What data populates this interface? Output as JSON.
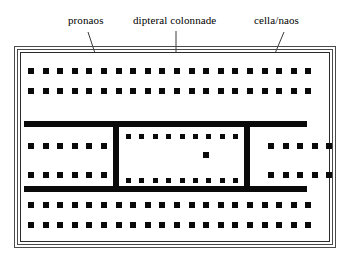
{
  "diagram": {
    "background": "#ffffff",
    "ink": "#0a0a0a",
    "frame_color": "#4a4a4a"
  },
  "labels": [
    {
      "id": "pronaos",
      "text": "pronaos",
      "x": 68,
      "y": 14
    },
    {
      "id": "dipteral",
      "text": "dipteral colonnade",
      "x": 133,
      "y": 14
    },
    {
      "id": "cella",
      "text": "cella/naos",
      "x": 254,
      "y": 14
    }
  ],
  "leaders": [
    {
      "id": "pronaos-leader",
      "x1": 88,
      "y1": 32,
      "x2": 124,
      "y2": 141
    },
    {
      "id": "dipteral-leader",
      "x1": 176,
      "y1": 31,
      "x2": 176,
      "y2": 79
    },
    {
      "id": "cella-leader",
      "x1": 284,
      "y1": 32,
      "x2": 231,
      "y2": 158
    }
  ],
  "frame": {
    "outer": {
      "x": 14,
      "y": 46,
      "w": 322,
      "h": 202
    },
    "mid": {
      "x": 17,
      "y": 49,
      "w": 316,
      "h": 196
    },
    "inner": {
      "x": 20,
      "y": 52,
      "w": 310,
      "h": 190
    }
  },
  "peristyle": {
    "description": "double outer colonnade rows, top and bottom",
    "columns_per_row": 20,
    "x_start": 28,
    "x_step": 14.6,
    "rows_y": [
      68,
      88,
      202,
      222
    ]
  },
  "side_colonnade": {
    "description": "inner side rows inside the middle zone, left and right of cella",
    "rows_y": [
      143,
      172
    ],
    "left_x_start": 28,
    "left_count": 6,
    "right_x_start": 268,
    "right_count": 5,
    "x_step": 14.6
  },
  "cella": {
    "wall_thickness": 6,
    "top_wall": {
      "x": 24,
      "y": 121,
      "w": 283,
      "h": 6
    },
    "bottom_wall": {
      "x": 24,
      "y": 186,
      "w": 283,
      "h": 6
    },
    "left_wall": {
      "x": 113,
      "y": 121,
      "w": 6,
      "h": 71
    },
    "right_wall": {
      "x": 244,
      "y": 121,
      "w": 6,
      "h": 71
    },
    "interior_rows_y": [
      134,
      178
    ],
    "interior_x_start": 126,
    "interior_count": 9,
    "interior_x_step": 13.4,
    "cult_statue": {
      "x": 203,
      "y": 152,
      "size": 6
    }
  }
}
